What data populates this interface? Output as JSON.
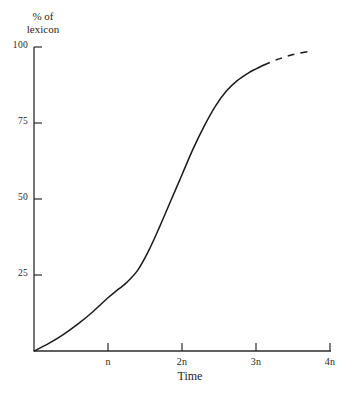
{
  "chart_data": {
    "type": "line",
    "title": "",
    "ylabel": "% of lexicon",
    "ylabel_lines": [
      "% of",
      "lexicon"
    ],
    "xlabel": "Time",
    "ylim": [
      0,
      100
    ],
    "xlim": [
      0,
      4
    ],
    "grid": false,
    "legend": null,
    "y_ticks": [
      {
        "value": 25,
        "label": "25"
      },
      {
        "value": 50,
        "label": "50"
      },
      {
        "value": 75,
        "label": "75"
      },
      {
        "value": 100,
        "label": "100"
      }
    ],
    "x_ticks": [
      {
        "value": 1,
        "label": "n"
      },
      {
        "value": 2,
        "label": "2n"
      },
      {
        "value": 3,
        "label": "3n"
      },
      {
        "value": 4,
        "label": "4n"
      }
    ],
    "series": [
      {
        "name": "lexical replacement curve (observed)",
        "style": "solid",
        "color": "#1a1a1a",
        "x": [
          0.0,
          0.2,
          0.4,
          0.6,
          0.8,
          1.0,
          1.15,
          1.25,
          1.4,
          1.55,
          1.7,
          1.85,
          2.0,
          2.15,
          2.3,
          2.45,
          2.6,
          2.75,
          2.9,
          3.0,
          3.1
        ],
        "y": [
          0.0,
          2.5,
          5.5,
          9.0,
          13.0,
          17.5,
          20.5,
          22.5,
          26.5,
          33.0,
          41.0,
          49.5,
          58.0,
          66.5,
          74.0,
          80.5,
          85.5,
          89.0,
          91.5,
          92.8,
          94.0
        ]
      },
      {
        "name": "lexical replacement curve (projected)",
        "style": "dashed",
        "color": "#1a1a1a",
        "x": [
          3.1,
          3.3,
          3.5,
          3.7
        ],
        "y": [
          94.0,
          96.0,
          97.5,
          98.5
        ]
      }
    ]
  }
}
